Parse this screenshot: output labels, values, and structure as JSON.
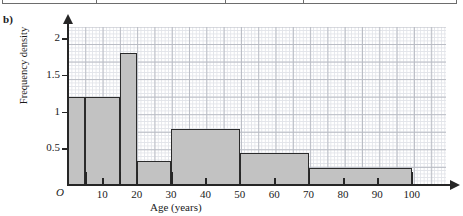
{
  "part_label": "b)",
  "table_fragment": {
    "present": true,
    "dividers": 3
  },
  "chart_data": {
    "type": "bar",
    "title": "",
    "xlabel": "Age (years)",
    "ylabel": "Frequency density",
    "xlim": [
      0,
      110
    ],
    "ylim": [
      0,
      2.15
    ],
    "grid": true,
    "legend": null,
    "origin_label": "O",
    "x_ticks": [
      10,
      20,
      30,
      40,
      50,
      60,
      70,
      80,
      90,
      100
    ],
    "x_tick_labels": [
      "10",
      "20",
      "30",
      "40",
      "50",
      "60",
      "70",
      "80",
      "90",
      "100"
    ],
    "bar_edges": [
      5,
      15,
      20,
      30,
      50,
      70,
      100
    ],
    "y_ticks": [
      0.5,
      1,
      1.5,
      2
    ],
    "y_tick_labels": [
      "0.5",
      "1",
      "1.5",
      "2"
    ],
    "bars": [
      {
        "label": "0-5",
        "x0": 0,
        "x1": 5,
        "value": 1.2
      },
      {
        "label": "5-15",
        "x0": 5,
        "x1": 15,
        "value": 1.2
      },
      {
        "label": "15-20",
        "x0": 15,
        "x1": 20,
        "value": 1.8
      },
      {
        "label": "20-30",
        "x0": 20,
        "x1": 30,
        "value": 0.32
      },
      {
        "label": "30-50",
        "x0": 30,
        "x1": 50,
        "value": 0.76
      },
      {
        "label": "50-70",
        "x0": 50,
        "x1": 70,
        "value": 0.43
      },
      {
        "label": "70-100",
        "x0": 70,
        "x1": 100,
        "value": 0.23
      }
    ],
    "colors": {
      "bar_fill": "#c2c2c2",
      "bar_stroke": "#2b2b2b",
      "axis": "#262626",
      "grid_major": "#b9bcc4",
      "grid_minor": "#e2e4e9"
    }
  }
}
